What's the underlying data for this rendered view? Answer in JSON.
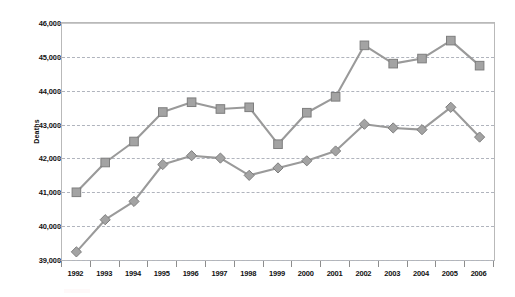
{
  "chart_data": {
    "type": "line",
    "title": "",
    "subtitle": "",
    "xlabel": "",
    "ylabel": "Deaths",
    "categories": [
      "1992",
      "1993",
      "1994",
      "1995",
      "1996",
      "1997",
      "1998",
      "1999",
      "2000",
      "2001",
      "2002",
      "2003",
      "2004",
      "2005",
      "2006"
    ],
    "ylim": [
      39000,
      46000
    ],
    "ytick_values": [
      39000,
      40000,
      41000,
      42000,
      43000,
      44000,
      45000,
      46000
    ],
    "ytick_labels": [
      "39,000",
      "40,000",
      "41,000",
      "42,000",
      "43,000",
      "44,000",
      "45,000",
      "46,000"
    ],
    "grid": true,
    "grid_axis": "y",
    "grid_style": "dashed",
    "legend": "none",
    "series": [
      {
        "name": "series-squares",
        "marker": "square",
        "color": "#a3a3a3",
        "values": [
          41000,
          41880,
          42500,
          43370,
          43660,
          43460,
          43510,
          42420,
          43350,
          43820,
          45340,
          44800,
          44950,
          45480,
          44740
        ]
      },
      {
        "name": "series-diamonds",
        "marker": "diamond",
        "color": "#a3a3a3",
        "values": [
          39240,
          40190,
          40730,
          41820,
          42080,
          42010,
          41500,
          41720,
          41930,
          42220,
          43010,
          42900,
          42850,
          43510,
          42630
        ]
      }
    ]
  },
  "axis": {
    "y_title": "Deaths"
  },
  "colors": {
    "marker_fill": "#a3a3a3",
    "marker_stroke": "#7e7e7e",
    "line": "#9a9a9a",
    "grid": "#b0b4bd",
    "frame": "#b9b9b9",
    "text": "#111111",
    "background": "#ffffff"
  }
}
